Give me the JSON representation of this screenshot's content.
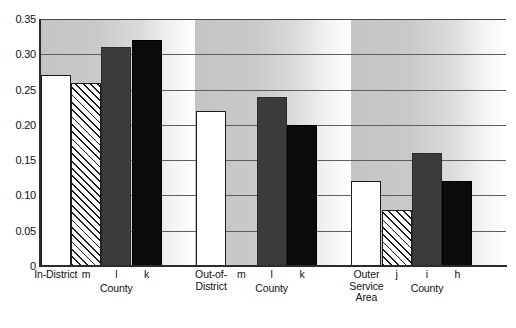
{
  "chart_data": {
    "type": "bar",
    "title": "",
    "subtitle": "",
    "xlabel": "",
    "ylabel": "",
    "ylim": [
      0,
      0.35
    ],
    "grid": true,
    "legend": "none",
    "yticks": [
      "0.35",
      "0.30",
      "0.25",
      "0.20",
      "0.15",
      "0.10",
      "0.05",
      "0"
    ],
    "ytick_values": [
      0.35,
      0.3,
      0.25,
      0.2,
      0.15,
      0.1,
      0.05,
      0
    ],
    "categories": [
      "In-District",
      "m",
      "l",
      "k",
      "Out-of-District",
      "m",
      "l",
      "k",
      "Outer Service Area",
      "j",
      "i",
      "h"
    ],
    "values": [
      0.27,
      0.26,
      0.31,
      0.32,
      0.22,
      0.0,
      0.24,
      0.2,
      0.12,
      0.08,
      0.16,
      0.12
    ],
    "groups": [
      {
        "caption": "County",
        "bars": [
          {
            "label_lines": [
              "In-District"
            ],
            "value": 0.27,
            "style": "white"
          },
          {
            "label_lines": [
              "m"
            ],
            "value": 0.26,
            "style": "hatch"
          },
          {
            "label_lines": [
              "l"
            ],
            "value": 0.31,
            "style": "darkgray"
          },
          {
            "label_lines": [
              "k"
            ],
            "value": 0.32,
            "style": "black"
          }
        ]
      },
      {
        "caption": "County",
        "bars": [
          {
            "label_lines": [
              "Out-of-",
              "District"
            ],
            "value": 0.22,
            "style": "white"
          },
          {
            "label_lines": [
              "m"
            ],
            "value": 0.0,
            "style": "hatch"
          },
          {
            "label_lines": [
              "l"
            ],
            "value": 0.24,
            "style": "darkgray"
          },
          {
            "label_lines": [
              "k"
            ],
            "value": 0.2,
            "style": "black"
          }
        ]
      },
      {
        "caption": "County",
        "bars": [
          {
            "label_lines": [
              "Outer",
              "Service",
              "Area"
            ],
            "value": 0.12,
            "style": "white"
          },
          {
            "label_lines": [
              "j"
            ],
            "value": 0.08,
            "style": "hatch"
          },
          {
            "label_lines": [
              "i"
            ],
            "value": 0.16,
            "style": "darkgray"
          },
          {
            "label_lines": [
              "h"
            ],
            "value": 0.12,
            "style": "black"
          }
        ]
      }
    ],
    "colors": {
      "bar_white": "#ffffff",
      "bar_hatch_line": "#1c1c1c",
      "bar_darkgray": "#3b3b3b",
      "bar_black": "#0b0b0b",
      "gridline": "#5d5d5d",
      "axis": "#2b2b2b",
      "panel_gradient_start": "#c4c4c4",
      "panel_gradient_end": "#ffffff",
      "text": "#111111"
    }
  }
}
